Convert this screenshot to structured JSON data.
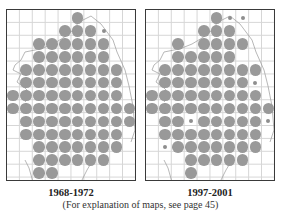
{
  "maps": [
    {
      "id": "left",
      "period_label": "1968-1972",
      "grid": {
        "cols": 10,
        "rows": 13
      },
      "big_dots": [
        [
          0,
          5
        ],
        [
          1,
          4
        ],
        [
          1,
          5
        ],
        [
          1,
          6
        ],
        [
          2,
          2
        ],
        [
          2,
          3
        ],
        [
          2,
          4
        ],
        [
          2,
          5
        ],
        [
          2,
          6
        ],
        [
          2,
          7
        ],
        [
          3,
          2
        ],
        [
          3,
          3
        ],
        [
          3,
          4
        ],
        [
          3,
          5
        ],
        [
          3,
          6
        ],
        [
          3,
          7
        ],
        [
          4,
          1
        ],
        [
          4,
          2
        ],
        [
          4,
          3
        ],
        [
          4,
          4
        ],
        [
          4,
          5
        ],
        [
          4,
          6
        ],
        [
          4,
          7
        ],
        [
          4,
          8
        ],
        [
          5,
          1
        ],
        [
          5,
          2
        ],
        [
          5,
          3
        ],
        [
          5,
          4
        ],
        [
          5,
          5
        ],
        [
          5,
          6
        ],
        [
          5,
          7
        ],
        [
          5,
          8
        ],
        [
          6,
          0
        ],
        [
          6,
          1
        ],
        [
          6,
          2
        ],
        [
          6,
          3
        ],
        [
          6,
          4
        ],
        [
          6,
          5
        ],
        [
          6,
          6
        ],
        [
          6,
          7
        ],
        [
          6,
          8
        ],
        [
          7,
          0
        ],
        [
          7,
          1
        ],
        [
          7,
          2
        ],
        [
          7,
          3
        ],
        [
          7,
          4
        ],
        [
          7,
          5
        ],
        [
          7,
          6
        ],
        [
          7,
          7
        ],
        [
          7,
          8
        ],
        [
          7,
          9
        ],
        [
          8,
          1
        ],
        [
          8,
          2
        ],
        [
          8,
          3
        ],
        [
          8,
          4
        ],
        [
          8,
          5
        ],
        [
          8,
          6
        ],
        [
          8,
          7
        ],
        [
          8,
          8
        ],
        [
          8,
          9
        ],
        [
          9,
          1
        ],
        [
          9,
          2
        ],
        [
          9,
          3
        ],
        [
          9,
          4
        ],
        [
          9,
          5
        ],
        [
          9,
          6
        ],
        [
          9,
          7
        ],
        [
          9,
          8
        ],
        [
          10,
          2
        ],
        [
          10,
          3
        ],
        [
          10,
          4
        ],
        [
          10,
          5
        ],
        [
          10,
          6
        ],
        [
          10,
          7
        ],
        [
          10,
          8
        ],
        [
          11,
          2
        ],
        [
          11,
          3
        ],
        [
          11,
          4
        ],
        [
          11,
          5
        ],
        [
          11,
          6
        ],
        [
          11,
          7
        ],
        [
          12,
          2
        ],
        [
          12,
          3
        ]
      ],
      "small_dots": [
        [
          1,
          7
        ]
      ]
    },
    {
      "id": "right",
      "period_label": "1997-2001",
      "grid": {
        "cols": 10,
        "rows": 13
      },
      "big_dots": [
        [
          0,
          5
        ],
        [
          1,
          4
        ],
        [
          1,
          5
        ],
        [
          1,
          6
        ],
        [
          2,
          2
        ],
        [
          2,
          4
        ],
        [
          2,
          5
        ],
        [
          2,
          6
        ],
        [
          2,
          7
        ],
        [
          3,
          2
        ],
        [
          3,
          3
        ],
        [
          3,
          4
        ],
        [
          3,
          5
        ],
        [
          3,
          6
        ],
        [
          4,
          1
        ],
        [
          4,
          2
        ],
        [
          4,
          3
        ],
        [
          4,
          4
        ],
        [
          4,
          5
        ],
        [
          4,
          6
        ],
        [
          4,
          7
        ],
        [
          4,
          8
        ],
        [
          5,
          1
        ],
        [
          5,
          2
        ],
        [
          5,
          3
        ],
        [
          5,
          4
        ],
        [
          5,
          5
        ],
        [
          5,
          6
        ],
        [
          5,
          7
        ],
        [
          6,
          0
        ],
        [
          6,
          1
        ],
        [
          6,
          2
        ],
        [
          6,
          3
        ],
        [
          6,
          4
        ],
        [
          6,
          5
        ],
        [
          6,
          6
        ],
        [
          6,
          7
        ],
        [
          6,
          8
        ],
        [
          7,
          0
        ],
        [
          7,
          1
        ],
        [
          7,
          2
        ],
        [
          7,
          3
        ],
        [
          7,
          4
        ],
        [
          7,
          5
        ],
        [
          7,
          6
        ],
        [
          7,
          7
        ],
        [
          7,
          8
        ],
        [
          7,
          9
        ],
        [
          8,
          1
        ],
        [
          8,
          2
        ],
        [
          8,
          4
        ],
        [
          8,
          5
        ],
        [
          8,
          6
        ],
        [
          8,
          7
        ],
        [
          8,
          8
        ],
        [
          9,
          1
        ],
        [
          9,
          2
        ],
        [
          9,
          3
        ],
        [
          9,
          4
        ],
        [
          9,
          5
        ],
        [
          9,
          6
        ],
        [
          9,
          7
        ],
        [
          9,
          8
        ],
        [
          10,
          2
        ],
        [
          10,
          3
        ],
        [
          10,
          4
        ],
        [
          10,
          5
        ],
        [
          10,
          6
        ],
        [
          10,
          7
        ],
        [
          10,
          8
        ],
        [
          11,
          3
        ],
        [
          11,
          4
        ],
        [
          11,
          5
        ],
        [
          11,
          6
        ],
        [
          11,
          7
        ],
        [
          12,
          3
        ]
      ],
      "small_dots": [
        [
          0,
          6
        ],
        [
          0,
          7
        ],
        [
          5,
          8
        ],
        [
          8,
          3
        ],
        [
          8,
          9
        ],
        [
          10,
          1
        ]
      ]
    }
  ],
  "footnote": "(For explanation of maps, see page 45)",
  "colors": {
    "dot": "#999999",
    "grid": "#d6d6d6",
    "border": "#3a3a3a",
    "coast": "#9a9a9a"
  }
}
